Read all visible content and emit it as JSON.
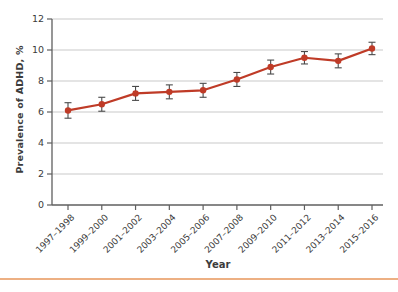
{
  "page": {
    "background": "#ffffff",
    "bottom_rule_color": "#edb083"
  },
  "chart_data": {
    "type": "line",
    "title": "",
    "xlabel": "Year",
    "ylabel": "Prevalence of ADHD, %",
    "categories": [
      "1997–1998",
      "1999–2000",
      "2001–2002",
      "2003–2004",
      "2005–2006",
      "2007–2008",
      "2009–2010",
      "2011–2012",
      "2013–2014",
      "2015–2016"
    ],
    "values": [
      6.1,
      6.5,
      7.2,
      7.3,
      7.4,
      8.1,
      8.9,
      9.5,
      9.3,
      10.1
    ],
    "errors": [
      0.5,
      0.45,
      0.45,
      0.45,
      0.45,
      0.45,
      0.45,
      0.4,
      0.45,
      0.4
    ],
    "ylim": [
      0,
      12
    ],
    "yticks": [
      0,
      2,
      4,
      6,
      8,
      10,
      12
    ],
    "grid": true,
    "legend": "none",
    "marker": "circle",
    "colors": {
      "line": "#bf3b27",
      "marker": "#bf3b27",
      "error_bar": "#4a4a4a",
      "grid": "#c9c9c9",
      "axis": "#5f5f5f",
      "text": "#3c3c3c"
    }
  }
}
